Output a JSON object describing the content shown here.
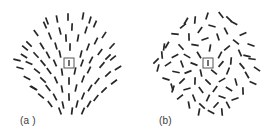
{
  "figure": {
    "background_color": "#ffffff",
    "segment_color": "#262626",
    "fixation_box_stroke": "#555555",
    "label_color": "#3a3a3a",
    "panels": [
      {
        "id": "a",
        "label": "(a )",
        "pattern_type": "radial-oriented-line-segments",
        "center": {
          "x": 68.5,
          "y": 62.5
        },
        "field_radius": 57,
        "fixation": {
          "x": 64,
          "y": 58,
          "width": 10,
          "height": 10
        },
        "segment_count": 72,
        "segment_length": 7.5,
        "segments": [
          {
            "cx": 68.0,
            "cy": 17.0,
            "angle": 90
          },
          {
            "cx": 83.0,
            "cy": 16.0,
            "angle": 100
          },
          {
            "cx": 57.0,
            "cy": 19.0,
            "angle": 80
          },
          {
            "cx": 95.0,
            "cy": 24.0,
            "angle": 113
          },
          {
            "cx": 45.0,
            "cy": 25.0,
            "angle": 66
          },
          {
            "cx": 72.0,
            "cy": 27.0,
            "angle": 93
          },
          {
            "cx": 60.0,
            "cy": 31.0,
            "angle": 76
          },
          {
            "cx": 86.0,
            "cy": 30.0,
            "angle": 107
          },
          {
            "cx": 36.0,
            "cy": 33.0,
            "angle": 55
          },
          {
            "cx": 104.0,
            "cy": 35.0,
            "angle": 123
          },
          {
            "cx": 50.0,
            "cy": 36.0,
            "angle": 68
          },
          {
            "cx": 96.0,
            "cy": 41.0,
            "angle": 117
          },
          {
            "cx": 66.0,
            "cy": 38.0,
            "angle": 87
          },
          {
            "cx": 78.0,
            "cy": 38.0,
            "angle": 100
          },
          {
            "cx": 29.0,
            "cy": 44.0,
            "angle": 43
          },
          {
            "cx": 112.0,
            "cy": 46.0,
            "angle": 133
          },
          {
            "cx": 42.0,
            "cy": 46.0,
            "angle": 58
          },
          {
            "cx": 88.0,
            "cy": 47.0,
            "angle": 110
          },
          {
            "cx": 56.0,
            "cy": 46.0,
            "angle": 74
          },
          {
            "cx": 70.0,
            "cy": 47.0,
            "angle": 91
          },
          {
            "cx": 100.0,
            "cy": 52.0,
            "angle": 126
          },
          {
            "cx": 36.0,
            "cy": 55.0,
            "angle": 47
          },
          {
            "cx": 24.0,
            "cy": 56.0,
            "angle": 33
          },
          {
            "cx": 48.0,
            "cy": 55.0,
            "angle": 62
          },
          {
            "cx": 81.0,
            "cy": 54.0,
            "angle": 104
          },
          {
            "cx": 60.0,
            "cy": 54.0,
            "angle": 78
          },
          {
            "cx": 113.0,
            "cy": 58.0,
            "angle": 140
          },
          {
            "cx": 91.0,
            "cy": 60.0,
            "angle": 118
          },
          {
            "cx": 29.0,
            "cy": 63.0,
            "angle": 25
          },
          {
            "cx": 43.0,
            "cy": 63.0,
            "angle": 50
          },
          {
            "cx": 55.0,
            "cy": 63.0,
            "angle": 66
          },
          {
            "cx": 82.0,
            "cy": 63.0,
            "angle": 110
          },
          {
            "cx": 102.0,
            "cy": 65.0,
            "angle": 131
          },
          {
            "cx": 20.0,
            "cy": 68.0,
            "angle": 16
          },
          {
            "cx": 118.0,
            "cy": 68.0,
            "angle": 148
          },
          {
            "cx": 37.0,
            "cy": 71.0,
            "angle": 38
          },
          {
            "cx": 49.0,
            "cy": 71.0,
            "angle": 55
          },
          {
            "cx": 62.0,
            "cy": 72.0,
            "angle": 82
          },
          {
            "cx": 75.0,
            "cy": 71.0,
            "angle": 102
          },
          {
            "cx": 89.0,
            "cy": 70.0,
            "angle": 117
          },
          {
            "cx": 108.0,
            "cy": 74.0,
            "angle": 138
          },
          {
            "cx": 27.0,
            "cy": 78.0,
            "angle": 27
          },
          {
            "cx": 43.0,
            "cy": 80.0,
            "angle": 42
          },
          {
            "cx": 56.0,
            "cy": 80.0,
            "angle": 67
          },
          {
            "cx": 69.0,
            "cy": 81.0,
            "angle": 90
          },
          {
            "cx": 83.0,
            "cy": 79.0,
            "angle": 110
          },
          {
            "cx": 97.0,
            "cy": 81.0,
            "angle": 128
          },
          {
            "cx": 34.0,
            "cy": 88.0,
            "angle": 32
          },
          {
            "cx": 114.0,
            "cy": 82.0,
            "angle": 143
          },
          {
            "cx": 48.0,
            "cy": 88.0,
            "angle": 52
          },
          {
            "cx": 62.0,
            "cy": 89.0,
            "angle": 80
          },
          {
            "cx": 76.0,
            "cy": 88.0,
            "angle": 103
          },
          {
            "cx": 90.0,
            "cy": 88.0,
            "angle": 121
          },
          {
            "cx": 104.0,
            "cy": 90.0,
            "angle": 135
          },
          {
            "cx": 41.0,
            "cy": 96.0,
            "angle": 40
          },
          {
            "cx": 55.0,
            "cy": 97.0,
            "angle": 62
          },
          {
            "cx": 69.0,
            "cy": 97.0,
            "angle": 88
          },
          {
            "cx": 83.0,
            "cy": 96.0,
            "angle": 112
          },
          {
            "cx": 96.0,
            "cy": 98.0,
            "angle": 128
          },
          {
            "cx": 50.0,
            "cy": 104.0,
            "angle": 54
          },
          {
            "cx": 63.0,
            "cy": 105.0,
            "angle": 78
          },
          {
            "cx": 77.0,
            "cy": 104.0,
            "angle": 104
          },
          {
            "cx": 89.0,
            "cy": 104.0,
            "angle": 120
          },
          {
            "cx": 60.0,
            "cy": 111.0,
            "angle": 70
          },
          {
            "cx": 72.0,
            "cy": 111.0,
            "angle": 97
          },
          {
            "cx": 47.0,
            "cy": 21.0,
            "angle": 70
          },
          {
            "cx": 90.0,
            "cy": 20.0,
            "angle": 106
          },
          {
            "cx": 33.0,
            "cy": 88.0,
            "angle": 30
          },
          {
            "cx": 108.0,
            "cy": 57.0,
            "angle": 134
          },
          {
            "cx": 25.0,
            "cy": 48.0,
            "angle": 40
          },
          {
            "cx": 17.0,
            "cy": 60.0,
            "angle": 14
          },
          {
            "cx": 83.0,
            "cy": 111.0,
            "angle": 113
          }
        ]
      },
      {
        "id": "b",
        "label": "(b)",
        "pattern_type": "random-oriented-line-segments",
        "center": {
          "x": 68.5,
          "y": 62.5
        },
        "field_radius": 57,
        "fixation": {
          "x": 64,
          "y": 58,
          "width": 10,
          "height": 10
        },
        "segment_count": 72,
        "segment_length": 7.5,
        "segments": [
          {
            "cx": 68.0,
            "cy": 16.0,
            "angle": 108
          },
          {
            "cx": 82.0,
            "cy": 15.0,
            "angle": 52
          },
          {
            "cx": 56.0,
            "cy": 20.0,
            "angle": 95
          },
          {
            "cx": 95.0,
            "cy": 23.0,
            "angle": 28
          },
          {
            "cx": 44.0,
            "cy": 26.0,
            "angle": 142
          },
          {
            "cx": 73.0,
            "cy": 26.0,
            "angle": 15
          },
          {
            "cx": 61.0,
            "cy": 30.0,
            "angle": 125
          },
          {
            "cx": 87.0,
            "cy": 31.0,
            "angle": 63
          },
          {
            "cx": 36.0,
            "cy": 34.0,
            "angle": 5
          },
          {
            "cx": 104.0,
            "cy": 34.0,
            "angle": 155
          },
          {
            "cx": 50.0,
            "cy": 37.0,
            "angle": 88
          },
          {
            "cx": 97.0,
            "cy": 42.0,
            "angle": 38
          },
          {
            "cx": 66.0,
            "cy": 39.0,
            "angle": 160
          },
          {
            "cx": 79.0,
            "cy": 37.0,
            "angle": 72
          },
          {
            "cx": 28.0,
            "cy": 45.0,
            "angle": 120
          },
          {
            "cx": 112.0,
            "cy": 45.0,
            "angle": 20
          },
          {
            "cx": 42.0,
            "cy": 47.0,
            "angle": 48
          },
          {
            "cx": 88.0,
            "cy": 48.0,
            "angle": 140
          },
          {
            "cx": 56.0,
            "cy": 45.0,
            "angle": 10
          },
          {
            "cx": 71.0,
            "cy": 48.0,
            "angle": 100
          },
          {
            "cx": 101.0,
            "cy": 53.0,
            "angle": 66
          },
          {
            "cx": 36.0,
            "cy": 56.0,
            "angle": 152
          },
          {
            "cx": 23.0,
            "cy": 55.0,
            "angle": 85
          },
          {
            "cx": 48.0,
            "cy": 56.0,
            "angle": 30
          },
          {
            "cx": 81.0,
            "cy": 55.0,
            "angle": 118
          },
          {
            "cx": 60.0,
            "cy": 55.0,
            "angle": 58
          },
          {
            "cx": 113.0,
            "cy": 59.0,
            "angle": 8
          },
          {
            "cx": 92.0,
            "cy": 61.0,
            "angle": 95
          },
          {
            "cx": 29.0,
            "cy": 64.0,
            "angle": 146
          },
          {
            "cx": 43.0,
            "cy": 64.0,
            "angle": 70
          },
          {
            "cx": 55.0,
            "cy": 64.0,
            "angle": 22
          },
          {
            "cx": 82.0,
            "cy": 64.0,
            "angle": 130
          },
          {
            "cx": 103.0,
            "cy": 66.0,
            "angle": 50
          },
          {
            "cx": 19.0,
            "cy": 68.0,
            "angle": 105
          },
          {
            "cx": 118.0,
            "cy": 69.0,
            "angle": 35
          },
          {
            "cx": 37.0,
            "cy": 72.0,
            "angle": 12
          },
          {
            "cx": 49.0,
            "cy": 72.0,
            "angle": 158
          },
          {
            "cx": 62.0,
            "cy": 73.0,
            "angle": 78
          },
          {
            "cx": 75.0,
            "cy": 72.0,
            "angle": 40
          },
          {
            "cx": 89.0,
            "cy": 71.0,
            "angle": 112
          },
          {
            "cx": 108.0,
            "cy": 75.0,
            "angle": 60
          },
          {
            "cx": 27.0,
            "cy": 79.0,
            "angle": 18
          },
          {
            "cx": 43.0,
            "cy": 81.0,
            "angle": 136
          },
          {
            "cx": 56.0,
            "cy": 81.0,
            "angle": 92
          },
          {
            "cx": 69.0,
            "cy": 82.0,
            "angle": 45
          },
          {
            "cx": 83.0,
            "cy": 80.0,
            "angle": 150
          },
          {
            "cx": 97.0,
            "cy": 82.0,
            "angle": 75
          },
          {
            "cx": 34.0,
            "cy": 89.0,
            "angle": 108
          },
          {
            "cx": 114.0,
            "cy": 83.0,
            "angle": 25
          },
          {
            "cx": 48.0,
            "cy": 89.0,
            "angle": 165
          },
          {
            "cx": 62.0,
            "cy": 90.0,
            "angle": 55
          },
          {
            "cx": 76.0,
            "cy": 89.0,
            "angle": 125
          },
          {
            "cx": 90.0,
            "cy": 89.0,
            "angle": 32
          },
          {
            "cx": 104.0,
            "cy": 91.0,
            "angle": 88
          },
          {
            "cx": 41.0,
            "cy": 97.0,
            "angle": 142
          },
          {
            "cx": 55.0,
            "cy": 98.0,
            "angle": 68
          },
          {
            "cx": 69.0,
            "cy": 98.0,
            "angle": 115
          },
          {
            "cx": 83.0,
            "cy": 97.0,
            "angle": 20
          },
          {
            "cx": 96.0,
            "cy": 99.0,
            "angle": 160
          },
          {
            "cx": 50.0,
            "cy": 105.0,
            "angle": 80
          },
          {
            "cx": 63.0,
            "cy": 106.0,
            "angle": 42
          },
          {
            "cx": 77.0,
            "cy": 105.0,
            "angle": 132
          },
          {
            "cx": 89.0,
            "cy": 105.0,
            "angle": 62
          },
          {
            "cx": 60.0,
            "cy": 112.0,
            "angle": 100
          },
          {
            "cx": 72.0,
            "cy": 112.0,
            "angle": 28
          },
          {
            "cx": 47.0,
            "cy": 21.0,
            "angle": 120
          },
          {
            "cx": 90.0,
            "cy": 19.0,
            "angle": 44
          },
          {
            "cx": 33.0,
            "cy": 87.0,
            "angle": 74
          },
          {
            "cx": 108.0,
            "cy": 56.0,
            "angle": 14
          },
          {
            "cx": 25.0,
            "cy": 47.0,
            "angle": 98
          },
          {
            "cx": 17.0,
            "cy": 61.0,
            "angle": 135
          },
          {
            "cx": 83.0,
            "cy": 112.0,
            "angle": 85
          }
        ]
      }
    ]
  }
}
